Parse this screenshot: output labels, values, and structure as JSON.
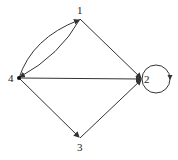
{
  "diagram": {
    "type": "directed-graph",
    "nodes": [
      {
        "id": "1",
        "label": "1",
        "x": 80,
        "y": 19,
        "lx": 78,
        "ly": 14
      },
      {
        "id": "2",
        "label": "2",
        "x": 142,
        "y": 79,
        "lx": 144,
        "ly": 83
      },
      {
        "id": "3",
        "label": "3",
        "x": 80,
        "y": 138,
        "lx": 77,
        "ly": 150
      },
      {
        "id": "4",
        "label": "4",
        "x": 19,
        "y": 78,
        "lx": 9,
        "ly": 82
      }
    ],
    "edges": [
      {
        "from": "4",
        "to": "1",
        "style": "curved-upper"
      },
      {
        "from": "1",
        "to": "4",
        "style": "curved-lower"
      },
      {
        "from": "1",
        "to": "2",
        "style": "straight"
      },
      {
        "from": "4",
        "to": "2",
        "style": "straight"
      },
      {
        "from": "4",
        "to": "3",
        "style": "straight"
      },
      {
        "from": "3",
        "to": "2",
        "style": "straight"
      },
      {
        "from": "2",
        "to": "2",
        "style": "self-loop"
      }
    ],
    "colors": {
      "stroke": "#333333",
      "text": "#222222",
      "background": "#ffffff"
    }
  }
}
